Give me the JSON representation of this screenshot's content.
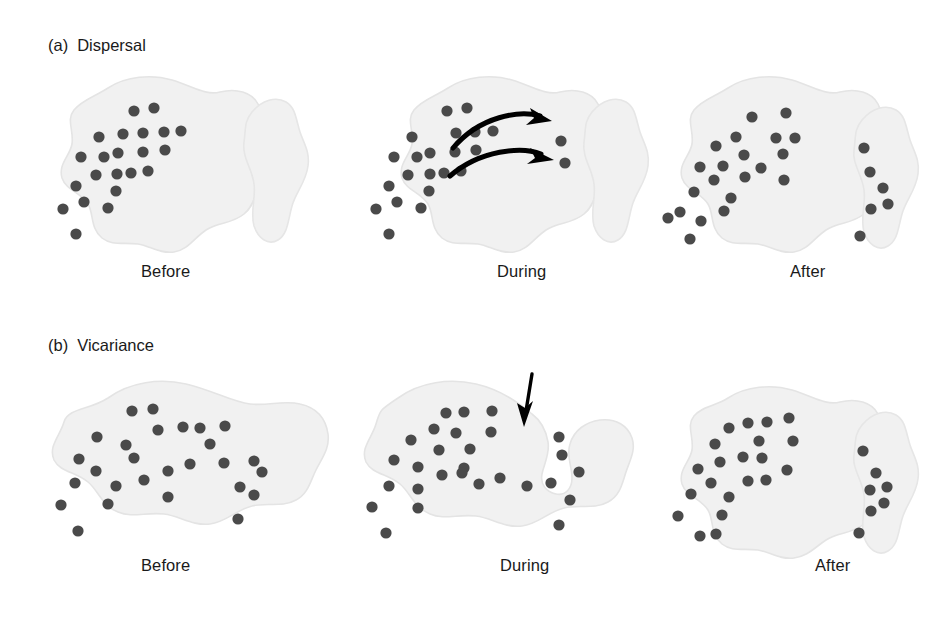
{
  "figure": {
    "background_color": "#ffffff",
    "landmass_fill": "#f1f1f1",
    "landmass_stroke": "#e2e2e2",
    "dot_color": "#4a4a4a",
    "arrow_color": "#000000",
    "text_color": "#1a1a1a"
  },
  "sections": [
    {
      "tag": "(a)",
      "title": "Dispersal",
      "stages": [
        {
          "label": "Before",
          "mainland_dots": 22,
          "island_dots": 0
        },
        {
          "label": "During",
          "mainland_dots": 21,
          "island_dots": 2
        },
        {
          "label": "After",
          "mainland_dots": 21,
          "island_dots": 6
        }
      ]
    },
    {
      "tag": "(b)",
      "title": "Vicariance",
      "stages": [
        {
          "label": "Before",
          "mainland_dots": 27,
          "island_dots": 0
        },
        {
          "label": "During",
          "mainland_dots": 21,
          "island_dots": 7
        },
        {
          "label": "After",
          "mainland_dots": 21,
          "island_dots": 7
        }
      ]
    }
  ],
  "labels": {
    "a_tag": "(a)",
    "a_title": "Dispersal",
    "b_tag": "(b)",
    "b_title": "Vicariance",
    "a_before": "Before",
    "a_during": "During",
    "a_after": "After",
    "b_before": "Before",
    "b_during": "During",
    "b_after": "After"
  },
  "annotations": {
    "dispersal_arrows": 2,
    "dispersal_arrow_direction": "left-to-right curved",
    "vicariance_arrows": 1,
    "vicariance_arrow_direction": "downward vertical"
  }
}
